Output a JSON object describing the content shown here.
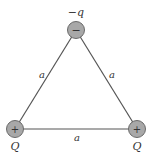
{
  "diagram": {
    "type": "equilateral-triangle-charges",
    "charges": [
      {
        "position": "top",
        "label": "−q",
        "sign": "−"
      },
      {
        "position": "bottom-left",
        "label": "Q",
        "sign": "+"
      },
      {
        "position": "bottom-right",
        "label": "Q",
        "sign": "+"
      }
    ],
    "sides": [
      {
        "position": "left",
        "label": "a"
      },
      {
        "position": "right",
        "label": "a"
      },
      {
        "position": "bottom",
        "label": "a"
      }
    ],
    "colors": {
      "line": "#555555",
      "charge_fill": "#a8a8a8",
      "charge_stroke": "#6a6a6a"
    }
  }
}
